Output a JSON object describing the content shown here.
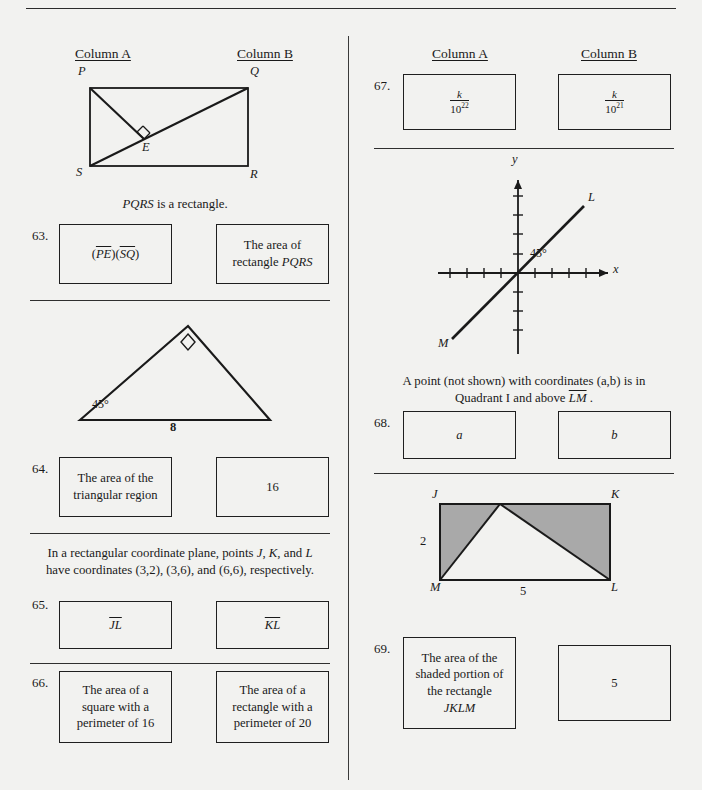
{
  "page": {
    "background_color": "#f2f2f0",
    "ink_color": "#1a1a1a",
    "shade_color": "#a9a9a9"
  },
  "left_column": {
    "headers": {
      "a": "Column A",
      "b": "Column B"
    },
    "figure_pqrs": {
      "vertices": [
        "P",
        "Q",
        "R",
        "S"
      ],
      "interior_point": "E",
      "right_angle_marker": true,
      "caption_prefix": "PQRS",
      "caption_suffix": " is a rectangle."
    },
    "q63": {
      "number": "63.",
      "a_parts": {
        "open": "(",
        "seg1": "PE",
        "mid": ")(",
        "seg2": "SQ",
        "close": ")"
      },
      "b_line1": "The area of",
      "b_line2_prefix": "rectangle ",
      "b_line2_ital": "PQRS"
    },
    "figure_triangle": {
      "angle_label": "45°",
      "base_label": "8",
      "right_angle_marker": true
    },
    "q64": {
      "number": "64.",
      "a_line1": "The area of the",
      "a_line2": "triangular region",
      "b": "16"
    },
    "stem65": {
      "line1_pre": "In a rectangular coordinate plane, points ",
      "line1_j": "J",
      "line1_c1": ", ",
      "line1_k": "K",
      "line1_c2": ", and ",
      "line1_l": "L",
      "line2": "have coordinates (3,2), (3,6), and (6,6), respectively."
    },
    "q65": {
      "number": "65.",
      "a": "JL",
      "b": "KL"
    },
    "q66": {
      "number": "66.",
      "a_line1": "The area of a",
      "a_line2": "square with a",
      "a_line3": "perimeter of 16",
      "b_line1": "The area of a",
      "b_line2": "rectangle with a",
      "b_line3": "perimeter of 20"
    }
  },
  "right_column": {
    "headers": {
      "a": "Column A",
      "b": "Column B"
    },
    "q67": {
      "number": "67.",
      "a_numerator": "k",
      "a_base": "10",
      "a_exponent": "22",
      "b_numerator": "k",
      "b_base": "10",
      "b_exponent": "21"
    },
    "figure_graph": {
      "x_axis_label": "x",
      "y_axis_label": "y",
      "angle_label": "45°",
      "point_upper": "L",
      "point_lower": "M"
    },
    "stem68": {
      "line1": "A point (not shown) with coordinates (a,b) is in",
      "line2_pre": "Quadrant I and above ",
      "line2_seg": "LM",
      "line2_post": " ."
    },
    "q68": {
      "number": "68.",
      "a": "a",
      "b": "b"
    },
    "figure_jklm": {
      "vertices": [
        "J",
        "K",
        "M",
        "L"
      ],
      "height_label": "2",
      "base_label": "5",
      "shaded": true
    },
    "q69": {
      "number": "69.",
      "a_line1": "The area of the",
      "a_line2": "shaded portion of",
      "a_line3": "the rectangle",
      "a_line4": "JKLM",
      "b": "5"
    }
  }
}
